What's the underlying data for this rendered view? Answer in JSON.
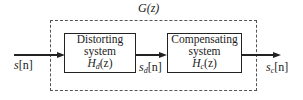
{
  "diagram": {
    "type": "block_diagram",
    "outer_group": {
      "label": "G(z)",
      "style": "dashed"
    },
    "blocks": [
      {
        "id": "distorting",
        "line1": "Distorting",
        "line2": "system",
        "tf_symbol": "H",
        "tf_sub": "d",
        "tf_arg": "(z)"
      },
      {
        "id": "compensating",
        "line1": "Compensating",
        "line2": "system",
        "tf_symbol": "H",
        "tf_sub": "c",
        "tf_arg": "(z)"
      }
    ],
    "signals": [
      {
        "id": "input",
        "symbol": "s",
        "sub": "",
        "arg": "[n]"
      },
      {
        "id": "intermediate",
        "symbol": "s",
        "sub": "d",
        "arg": "[n]"
      },
      {
        "id": "output",
        "symbol": "s",
        "sub": "c",
        "arg": "[n]"
      }
    ],
    "edges": [
      {
        "from": "input",
        "to": "distorting"
      },
      {
        "from": "distorting",
        "to": "compensating",
        "label": "intermediate"
      },
      {
        "from": "compensating",
        "to": "output"
      }
    ]
  }
}
